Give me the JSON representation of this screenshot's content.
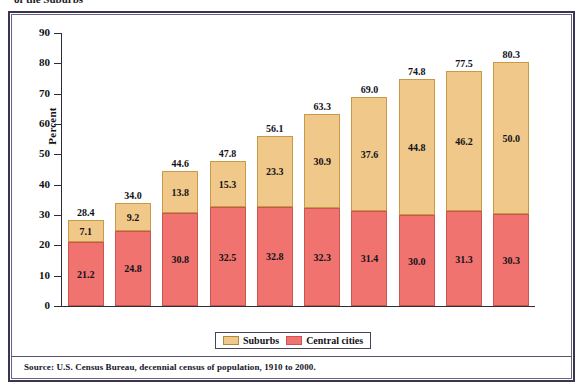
{
  "figure": {
    "title_sliver": "of the Suburbs",
    "source_note": "Source:  U.S. Census Bureau, decennial census of population, 1910 to 2000."
  },
  "legend": {
    "items": [
      {
        "label": "Suburbs",
        "color": "#f0c88a",
        "swatch_name": "suburbs-swatch"
      },
      {
        "label": "Central cities",
        "color": "#f0736f",
        "swatch_name": "central-cities-swatch"
      }
    ]
  },
  "axes": {
    "ylabel": "Percent",
    "yticks": [
      "0",
      "10",
      "20",
      "30",
      "40",
      "50",
      "60",
      "70",
      "80",
      "90"
    ],
    "xticks": [
      "1910",
      "1920",
      "1930",
      "1940",
      "1950",
      "1960",
      "1970",
      "1980",
      "1990",
      "2000"
    ]
  },
  "chart_data": {
    "type": "bar",
    "subtype": "stacked",
    "title": "of the Suburbs",
    "xlabel": "",
    "ylabel": "Percent",
    "ylim": [
      0,
      90
    ],
    "ytick_step": 10,
    "grid": false,
    "legend_position": "bottom-center",
    "categories": [
      "1910",
      "1920",
      "1930",
      "1940",
      "1950",
      "1960",
      "1970",
      "1980",
      "1990",
      "2000"
    ],
    "series": [
      {
        "name": "Central cities",
        "color": "#f0736f",
        "values": [
          21.2,
          24.8,
          30.8,
          32.5,
          32.8,
          32.3,
          31.4,
          30.0,
          31.3,
          30.3
        ]
      },
      {
        "name": "Suburbs",
        "color": "#f0c88a",
        "values": [
          7.1,
          9.2,
          13.8,
          15.3,
          23.3,
          30.9,
          37.6,
          44.8,
          46.2,
          50.0
        ]
      }
    ],
    "totals": [
      28.4,
      34.0,
      44.6,
      47.8,
      56.1,
      63.3,
      69.0,
      74.8,
      77.5,
      80.3
    ],
    "annotations": {
      "total_labels_above_bars": true,
      "segment_value_labels": true
    }
  }
}
